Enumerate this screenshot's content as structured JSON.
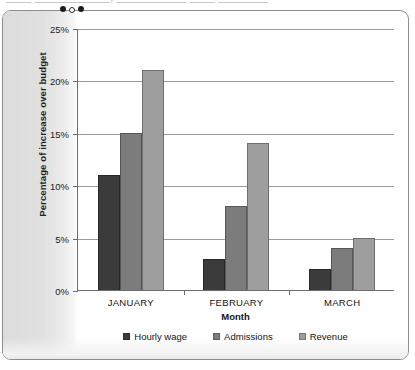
{
  "page": {
    "top_cut_text": "____  ____________,  ___________  ____  ________"
  },
  "chart_data": {
    "type": "bar",
    "title": "",
    "xlabel": "Month",
    "ylabel": "Percentage of increase over budget",
    "categories": [
      "JANUARY",
      "FEBRUARY",
      "MARCH"
    ],
    "series": [
      {
        "name": "Hourly wage",
        "color": "#3b3b3b",
        "values": [
          11,
          3,
          2
        ]
      },
      {
        "name": "Admissions",
        "color": "#7c7c7c",
        "values": [
          15,
          8,
          4
        ]
      },
      {
        "name": "Revenue",
        "color": "#9e9e9e",
        "values": [
          21,
          14,
          5
        ]
      }
    ],
    "ylim": [
      0,
      25
    ],
    "ytick_values": [
      0,
      5,
      10,
      15,
      20,
      25
    ],
    "ytick_labels": [
      "0%",
      "5%",
      "10%",
      "15%",
      "20%",
      "25%"
    ],
    "grid": true,
    "legend_position": "bottom"
  }
}
